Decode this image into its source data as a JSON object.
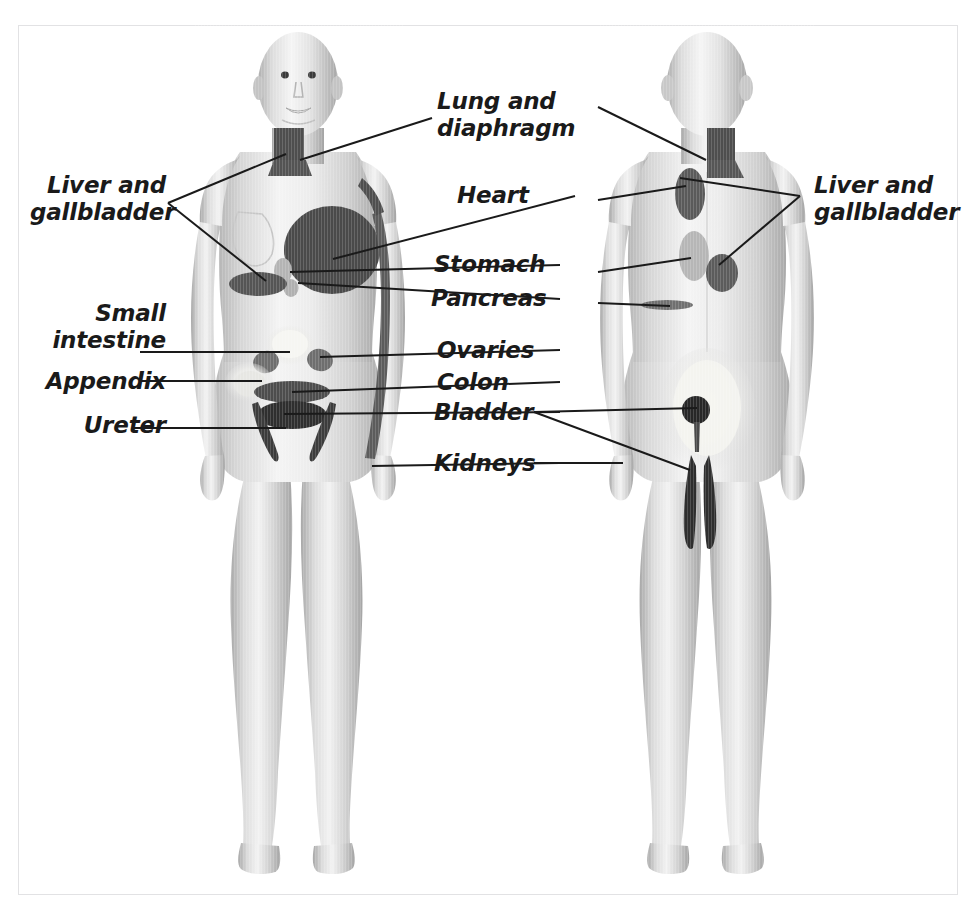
{
  "figure": {
    "background": "#ffffff",
    "frame_color": "#e2e2e4"
  },
  "palette": {
    "dark_pain": "#4a4a4a",
    "darkest_pain": "#2e2e2e",
    "mid_pain": "#6e6e6e",
    "light_pain": "#b4b4b4",
    "pale_pain": "#f2f2ee",
    "skin_light": "#f2f2f2",
    "skin_mid": "#d2d2d2",
    "skin_shade": "#b0b0b0",
    "leader_line": "#1a1a1a",
    "text": "#1a1a1a"
  },
  "labels": [
    {
      "id": "lung-and-diaphragm",
      "text": "Lung and\ndiaphragm",
      "align": "left",
      "x": 437,
      "y": 88,
      "width": 170
    },
    {
      "id": "heart",
      "text": "Heart",
      "align": "left",
      "x": 457,
      "y": 182,
      "width": 140
    },
    {
      "id": "stomach",
      "text": "Stomach",
      "align": "left",
      "x": 434,
      "y": 251,
      "width": 150
    },
    {
      "id": "pancreas",
      "text": "Pancreas",
      "align": "left",
      "x": 431,
      "y": 285,
      "width": 150
    },
    {
      "id": "ovaries",
      "text": "Ovaries",
      "align": "left",
      "x": 437,
      "y": 337,
      "width": 150
    },
    {
      "id": "colon",
      "text": "Colon",
      "align": "left",
      "x": 437,
      "y": 369,
      "width": 150
    },
    {
      "id": "bladder",
      "text": "Bladder",
      "align": "left",
      "x": 434,
      "y": 399,
      "width": 150
    },
    {
      "id": "kidneys",
      "text": "Kidneys",
      "align": "left",
      "x": 434,
      "y": 450,
      "width": 150
    },
    {
      "id": "liver-and-gallbladder-left",
      "text": "Liver and\ngallbladder",
      "align": "right",
      "x": 30,
      "y": 172,
      "width": 136
    },
    {
      "id": "small-intestine",
      "text": "Small\nintestine",
      "align": "right",
      "x": 24,
      "y": 300,
      "width": 142
    },
    {
      "id": "appendix",
      "text": "Appendix",
      "align": "right",
      "x": 24,
      "y": 368,
      "width": 142
    },
    {
      "id": "ureter",
      "text": "Ureter",
      "align": "right",
      "x": 24,
      "y": 412,
      "width": 142
    },
    {
      "id": "liver-and-gallbladder-right",
      "text": "Liver and\ngallbladder",
      "align": "left",
      "x": 814,
      "y": 172,
      "width": 150
    }
  ],
  "leader_lines": [
    {
      "id": "leader-lung-diaphragm-front",
      "points": "432,118 300,160"
    },
    {
      "id": "leader-heart-front",
      "points": "575,196 333,259"
    },
    {
      "id": "leader-stomach-front",
      "points": "560,265 290,272"
    },
    {
      "id": "leader-pancreas-front",
      "points": "560,299 298,283"
    },
    {
      "id": "leader-ovaries-front",
      "points": "560,350 320,357"
    },
    {
      "id": "leader-colon-front",
      "points": "560,382 292,392"
    },
    {
      "id": "leader-bladder-front",
      "points": "560,412 284,414"
    },
    {
      "id": "leader-kidneys-front",
      "points": "560,463 372,466"
    },
    {
      "id": "leader-liver-v-front-a",
      "points": "168,203 172,200 286,154"
    },
    {
      "id": "leader-liver-v-front-b",
      "points": "168,203 266,281"
    },
    {
      "id": "leader-small-intestine",
      "points": "140,352 290,352"
    },
    {
      "id": "leader-appendix",
      "points": "140,381 262,381"
    },
    {
      "id": "leader-ureter",
      "points": "132,428 286,428"
    },
    {
      "id": "leader-liver-v-back-a",
      "points": "800,196 680,178"
    },
    {
      "id": "leader-liver-v-back-b",
      "points": "800,196 719,265"
    },
    {
      "id": "leader-lung-diaphragm-back",
      "points": "598,107 706,160"
    },
    {
      "id": "leader-heart-back",
      "points": "598,200 686,186"
    },
    {
      "id": "leader-stomach-back",
      "points": "598,272 691,258"
    },
    {
      "id": "leader-pancreas-back",
      "points": "598,303 670,306"
    },
    {
      "id": "leader-bladder-back-a",
      "points": "534,412 697,408"
    },
    {
      "id": "leader-bladder-back-b",
      "points": "534,412 690,470"
    },
    {
      "id": "leader-kidneys-back",
      "points": "534,463 623,463"
    }
  ],
  "figures": [
    {
      "id": "front-view",
      "view": "anterior",
      "regions": [
        {
          "id": "neck-chest-patch-front",
          "organ": "Lung and diaphragm",
          "shade": "dark"
        },
        {
          "id": "heart-patch-front",
          "organ": "Heart",
          "shade": "dark"
        },
        {
          "id": "inner-arm-strip-front",
          "organ": "Heart",
          "shade": "dark"
        },
        {
          "id": "stomach-patch-front",
          "organ": "Stomach",
          "shade": "light"
        },
        {
          "id": "pancreas-patch-front",
          "organ": "Pancreas",
          "shade": "light"
        },
        {
          "id": "liver-patch-front",
          "organ": "Liver and gallbladder",
          "shade": "dark"
        },
        {
          "id": "small-intestine-patch",
          "organ": "Small intestine",
          "shade": "pale"
        },
        {
          "id": "ovary-patch-left",
          "organ": "Ovaries",
          "shade": "mid"
        },
        {
          "id": "ovary-patch-right",
          "organ": "Ovaries",
          "shade": "mid"
        },
        {
          "id": "appendix-patch",
          "organ": "Appendix",
          "shade": "light"
        },
        {
          "id": "colon-patch",
          "organ": "Colon",
          "shade": "dark"
        },
        {
          "id": "bladder-patch-front",
          "organ": "Bladder",
          "shade": "darkest"
        },
        {
          "id": "ureter-strip-left",
          "organ": "Ureter",
          "shade": "dark"
        },
        {
          "id": "ureter-strip-right",
          "organ": "Ureter",
          "shade": "dark"
        },
        {
          "id": "kidney-flank-front",
          "organ": "Kidneys",
          "shade": "light"
        }
      ]
    },
    {
      "id": "back-view",
      "view": "posterior",
      "regions": [
        {
          "id": "neck-patch-back",
          "organ": "Lung and diaphragm",
          "shade": "dark"
        },
        {
          "id": "heart-patch-back",
          "organ": "Heart",
          "shade": "dark"
        },
        {
          "id": "stomach-patch-back",
          "organ": "Stomach",
          "shade": "light"
        },
        {
          "id": "liver-patch-back",
          "organ": "Liver and gallbladder",
          "shade": "dark"
        },
        {
          "id": "pancreas-strip-back",
          "organ": "Pancreas",
          "shade": "mid"
        },
        {
          "id": "kidney-patch-back",
          "organ": "Kidneys",
          "shade": "pale"
        },
        {
          "id": "bladder-spot-back",
          "organ": "Bladder",
          "shade": "darkest"
        },
        {
          "id": "thigh-strip-left",
          "organ": "Bladder",
          "shade": "darkest"
        },
        {
          "id": "thigh-strip-right",
          "organ": "Bladder",
          "shade": "darkest"
        }
      ]
    }
  ]
}
